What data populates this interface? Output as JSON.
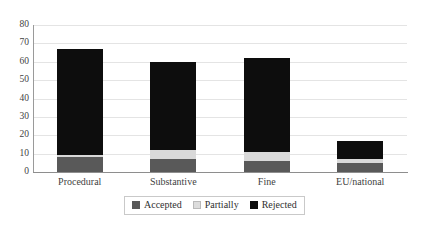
{
  "chart_data": {
    "type": "bar",
    "subtype": "stacked-vertical",
    "title": "",
    "xlabel": "",
    "ylabel": "",
    "ylim": [
      0,
      80
    ],
    "yticks": [
      80,
      70,
      60,
      50,
      40,
      30,
      20,
      10,
      0
    ],
    "grid": true,
    "legend_position": "bottom",
    "categories": [
      "Procedural",
      "Substantive",
      "Fine",
      "EU/national"
    ],
    "series": [
      {
        "name": "Accepted",
        "color": "#595959",
        "values": [
          8,
          7,
          6,
          5
        ]
      },
      {
        "name": "Partially",
        "color": "#d9d9d9",
        "values": [
          1,
          5,
          5,
          2
        ]
      },
      {
        "name": "Rejected",
        "color": "#0d0d0d",
        "values": [
          58,
          48,
          51,
          10
        ]
      }
    ],
    "totals": [
      67,
      60,
      62,
      17
    ]
  },
  "axes": {
    "y_tick_labels": [
      "80",
      "70",
      "60",
      "50",
      "40",
      "30",
      "20",
      "10",
      "0"
    ],
    "x_tick_labels": [
      "Procedural",
      "Substantive",
      "Fine",
      "EU/national"
    ]
  },
  "legend": {
    "items": [
      {
        "label": "Accepted",
        "swatch": "accepted-swatch"
      },
      {
        "label": "Partially",
        "swatch": "partially-swatch"
      },
      {
        "label": "Rejected",
        "swatch": "rejected-swatch"
      }
    ]
  },
  "colors": {
    "accepted": "#595959",
    "partially": "#d9d9d9",
    "rejected": "#0d0d0d",
    "gridline": "#e4e4e4",
    "axis": "#8e8e8e"
  }
}
